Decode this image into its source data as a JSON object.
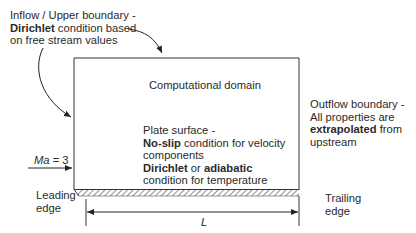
{
  "labels": {
    "inflow": {
      "line1": "Inflow / Upper boundary -",
      "line2_bold": "Dirichlet",
      "line2_rest": " condition based",
      "line3": "on free stream values"
    },
    "domain": "Computational domain",
    "outflow": {
      "line1": "Outflow boundary -",
      "line2": "All properties are",
      "line3_bold": "extrapolated",
      "line3_rest": " from",
      "line4": "upstream"
    },
    "plate": {
      "line1": "Plate surface -",
      "line2_bold": "No-slip",
      "line2_rest": " condition for velocity",
      "line3": "components",
      "line4_bold1": "Dirichlet",
      "line4_mid": " or ",
      "line4_bold2": "adiabatic",
      "line5": "condition for temperature"
    },
    "mach": {
      "symbol": "Ma",
      "value": " = 3"
    },
    "leading_edge": {
      "line1": "Leading",
      "line2": "edge"
    },
    "trailing_edge": {
      "line1": "Trailing",
      "line2": "edge"
    },
    "length": "L"
  },
  "colors": {
    "line": "#333333",
    "text": "#2a2a2a"
  }
}
